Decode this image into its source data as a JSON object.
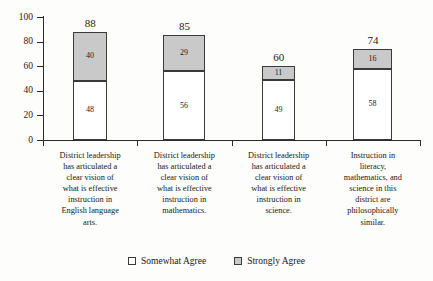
{
  "chart_data": {
    "type": "bar",
    "subtype": "stacked-bar",
    "title": "",
    "xlabel": "",
    "ylabel": "",
    "ylim": [
      0,
      100
    ],
    "yticks": [
      0,
      20,
      40,
      60,
      80,
      100
    ],
    "grid": false,
    "legend_position": "bottom-center",
    "categories": [
      "District leadership has articulated a clear vision of what is effective instruction in English language arts.",
      "District leadership has articulated a clear vision of what is effective instruction in mathematics.",
      "District leadership has articulated a clear vision of what is effective instruction in science.",
      "Instruction in literacy, mathematics, and science in this district are philosophically similar."
    ],
    "series": [
      {
        "name": "Somewhat Agree",
        "color": "#ffffff",
        "values": [
          48,
          56,
          49,
          58
        ]
      },
      {
        "name": "Strongly Agree",
        "color": "#c9c9c9",
        "values": [
          40,
          29,
          11,
          16
        ]
      }
    ],
    "totals": [
      88,
      85,
      60,
      74
    ]
  },
  "axis": {
    "y_tick_labels": [
      "100",
      "80",
      "60",
      "40",
      "20",
      "0"
    ]
  },
  "bars": [
    {
      "total_label": "88",
      "bottom_label": "48",
      "top_label": "40",
      "caption_lines": [
        "District leadership",
        "has articulated a",
        "clear vision of",
        "what is effective",
        "instruction in",
        "English language",
        "arts."
      ]
    },
    {
      "total_label": "85",
      "bottom_label": "56",
      "top_label": "29",
      "caption_lines": [
        "District leadership",
        "has articulated a",
        "clear vision of",
        "what is effective",
        "instruction in",
        "mathematics."
      ]
    },
    {
      "total_label": "60",
      "bottom_label": "49",
      "top_label": "11",
      "caption_lines": [
        "District leadership",
        "has articulated a",
        "clear vision of",
        "what is effective",
        "instruction in",
        "science."
      ]
    },
    {
      "total_label": "74",
      "bottom_label": "58",
      "top_label": "16",
      "caption_lines": [
        "Instruction in",
        "literacy,",
        "mathematics, and",
        "science in this",
        "district are",
        "philosophically",
        "similar."
      ]
    }
  ],
  "legend": {
    "items": [
      {
        "label": "Somewhat Agree",
        "swatch": "white-square-icon"
      },
      {
        "label": "Strongly Agree",
        "swatch": "gray-square-icon"
      }
    ]
  }
}
